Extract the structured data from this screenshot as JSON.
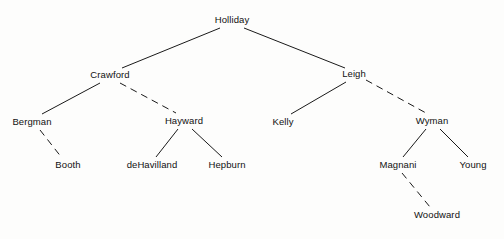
{
  "diagram": {
    "type": "hierarchical-tree",
    "title": "",
    "background_color": "#fdfdfc",
    "line_color": "#1a1a1a",
    "text_color": "#111111",
    "width": 504,
    "height": 239,
    "nodes": [
      {
        "id": "holliday",
        "label": "Holliday",
        "x": 232,
        "y": 20,
        "depth": 0
      },
      {
        "id": "crawford",
        "label": "Crawford",
        "x": 110,
        "y": 75,
        "depth": 1
      },
      {
        "id": "leigh",
        "label": "Leigh",
        "x": 354,
        "y": 74,
        "depth": 1
      },
      {
        "id": "bergman",
        "label": "Bergman",
        "x": 32,
        "y": 122,
        "depth": 2
      },
      {
        "id": "hayward",
        "label": "Hayward",
        "x": 184,
        "y": 121,
        "depth": 2
      },
      {
        "id": "kelly",
        "label": "Kelly",
        "x": 283,
        "y": 122,
        "depth": 2
      },
      {
        "id": "wyman",
        "label": "Wyman",
        "x": 432,
        "y": 121,
        "depth": 2
      },
      {
        "id": "booth",
        "label": "Booth",
        "x": 68,
        "y": 165,
        "depth": 3
      },
      {
        "id": "dehavilland",
        "label": "deHavilland",
        "x": 152,
        "y": 165,
        "depth": 3
      },
      {
        "id": "hepburn",
        "label": "Hepburn",
        "x": 227,
        "y": 165,
        "depth": 3
      },
      {
        "id": "magnani",
        "label": "Magnani",
        "x": 398,
        "y": 165,
        "depth": 3
      },
      {
        "id": "young",
        "label": "Young",
        "x": 473,
        "y": 165,
        "depth": 3
      },
      {
        "id": "woodward",
        "label": "Woodward",
        "x": 437,
        "y": 215,
        "depth": 4
      }
    ],
    "edges": [
      {
        "from": "holliday",
        "to": "crawford",
        "style": "solid",
        "x1": 220,
        "y1": 28,
        "x2": 122,
        "y2": 68
      },
      {
        "from": "holliday",
        "to": "leigh",
        "style": "solid",
        "x1": 244,
        "y1": 28,
        "x2": 345,
        "y2": 68
      },
      {
        "from": "crawford",
        "to": "bergman",
        "style": "solid",
        "x1": 100,
        "y1": 83,
        "x2": 42,
        "y2": 114
      },
      {
        "from": "crawford",
        "to": "hayward",
        "style": "dashed",
        "x1": 120,
        "y1": 83,
        "x2": 176,
        "y2": 113
      },
      {
        "from": "leigh",
        "to": "kelly",
        "style": "solid",
        "x1": 346,
        "y1": 82,
        "x2": 291,
        "y2": 114
      },
      {
        "from": "leigh",
        "to": "wyman",
        "style": "dashed",
        "x1": 366,
        "y1": 80,
        "x2": 426,
        "y2": 113
      },
      {
        "from": "bergman",
        "to": "booth",
        "style": "dashed",
        "x1": 40,
        "y1": 130,
        "x2": 62,
        "y2": 158
      },
      {
        "from": "hayward",
        "to": "dehavilland",
        "style": "solid",
        "x1": 178,
        "y1": 129,
        "x2": 156,
        "y2": 157
      },
      {
        "from": "hayward",
        "to": "hepburn",
        "style": "solid",
        "x1": 192,
        "y1": 129,
        "x2": 222,
        "y2": 157
      },
      {
        "from": "wyman",
        "to": "magnani",
        "style": "solid",
        "x1": 426,
        "y1": 129,
        "x2": 403,
        "y2": 157
      },
      {
        "from": "wyman",
        "to": "young",
        "style": "solid",
        "x1": 440,
        "y1": 129,
        "x2": 468,
        "y2": 157
      },
      {
        "from": "magnani",
        "to": "woodward",
        "style": "dashed",
        "x1": 402,
        "y1": 173,
        "x2": 430,
        "y2": 207
      }
    ]
  }
}
